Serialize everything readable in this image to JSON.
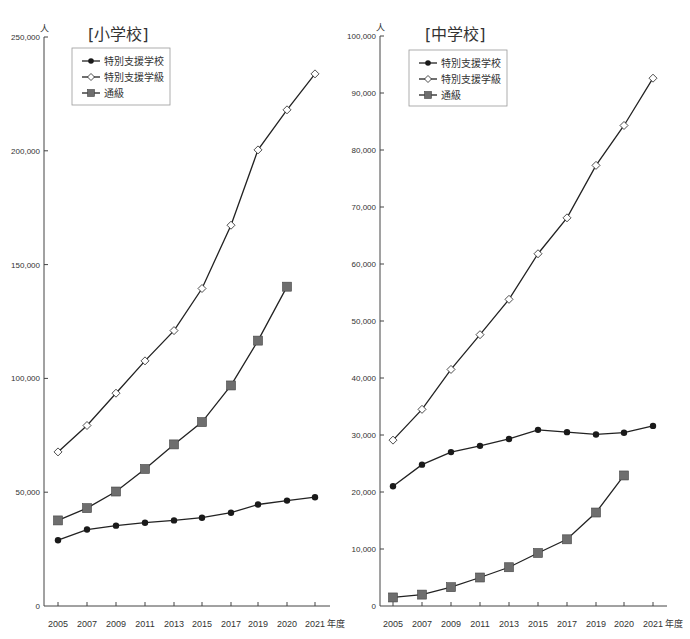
{
  "chart_data": [
    {
      "type": "line",
      "title": "[小学校]",
      "ylabel": "人",
      "xlabel": "年度",
      "categories": [
        "2005",
        "2007",
        "2009",
        "2011",
        "2013",
        "2015",
        "2017",
        "2019",
        "2020",
        "2021"
      ],
      "ylim": [
        0,
        250000
      ],
      "yticks": [
        0,
        50000,
        100000,
        150000,
        200000,
        250000
      ],
      "ytick_labels": [
        "0",
        "50,000",
        "100,000",
        "150,000",
        "200,000",
        "250,000"
      ],
      "legend_position": "upper-left",
      "grid": false,
      "series": [
        {
          "name": "特別支援学校",
          "marker": "filled-circle",
          "values": [
            28900,
            33600,
            35300,
            36600,
            37600,
            38800,
            41000,
            44600,
            46300,
            47800
          ]
        },
        {
          "name": "特別支援学級",
          "marker": "open-diamond",
          "values": [
            67700,
            79300,
            93500,
            107700,
            121000,
            139500,
            167300,
            200400,
            218000,
            233800
          ]
        },
        {
          "name": "通級",
          "marker": "gray-square",
          "values": [
            37600,
            43000,
            50300,
            60200,
            71000,
            80800,
            96900,
            116600,
            140300,
            null
          ]
        }
      ]
    },
    {
      "type": "line",
      "title": "[中学校]",
      "ylabel": "人",
      "xlabel": "年度",
      "categories": [
        "2005",
        "2007",
        "2009",
        "2011",
        "2013",
        "2015",
        "2017",
        "2019",
        "2020",
        "2021"
      ],
      "ylim": [
        0,
        100000
      ],
      "yticks": [
        0,
        10000,
        20000,
        30000,
        40000,
        50000,
        60000,
        70000,
        80000,
        90000,
        100000
      ],
      "ytick_labels": [
        "0",
        "10,000",
        "20,000",
        "30,000",
        "40,000",
        "50,000",
        "60,000",
        "70,000",
        "80,000",
        "90,000",
        "100,000"
      ],
      "legend_position": "upper-left",
      "grid": false,
      "series": [
        {
          "name": "特別支援学校",
          "marker": "filled-circle",
          "values": [
            21000,
            24800,
            27000,
            28100,
            29300,
            30900,
            30500,
            30100,
            30400,
            31600
          ]
        },
        {
          "name": "特別支援学級",
          "marker": "open-diamond",
          "values": [
            29100,
            34500,
            41500,
            47600,
            53800,
            61800,
            68100,
            77300,
            84300,
            92600
          ]
        },
        {
          "name": "通級",
          "marker": "gray-square",
          "values": [
            1500,
            2000,
            3300,
            5000,
            6800,
            9300,
            11700,
            16400,
            22900,
            null
          ]
        }
      ]
    }
  ],
  "colors": {
    "line": "#222222",
    "circle": "#1a1a1a",
    "diamond_fill": "#ffffff",
    "square_fill": "#6e6e6e",
    "axis": "#444444"
  }
}
